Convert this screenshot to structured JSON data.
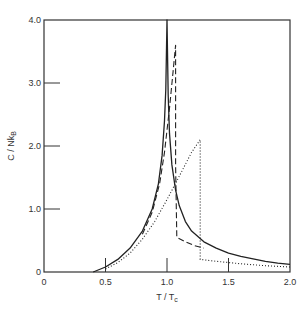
{
  "chart_data": {
    "type": "line",
    "title": "",
    "xlabel": "T / T_c",
    "ylabel": "C / Nk_B",
    "xlim": [
      0,
      2.0
    ],
    "ylim": [
      0,
      4.0
    ],
    "grid": false,
    "legend": null,
    "xticks": [
      {
        "value": 0,
        "label": "0"
      },
      {
        "value": 0.5,
        "label": "0.5"
      },
      {
        "value": 1.0,
        "label": "1.0"
      },
      {
        "value": 1.5,
        "label": "1.5"
      },
      {
        "value": 2.0,
        "label": "2.0"
      }
    ],
    "yticks": [
      {
        "value": 0,
        "label": "0"
      },
      {
        "value": 1.0,
        "label": "1.0"
      },
      {
        "value": 2.0,
        "label": "2.0"
      },
      {
        "value": 3.0,
        "label": "3.0"
      },
      {
        "value": 4.0,
        "label": "4.0"
      }
    ],
    "series": [
      {
        "name": "solid",
        "style": "solid",
        "x": [
          0.4,
          0.5,
          0.6,
          0.7,
          0.8,
          0.88,
          0.93,
          0.96,
          0.98,
          0.99,
          1.0,
          1.0,
          1.01,
          1.02,
          1.04,
          1.07,
          1.1,
          1.15,
          1.2,
          1.3,
          1.4,
          1.5,
          1.6,
          1.7,
          1.8,
          1.9,
          2.0
        ],
        "y": [
          0.0,
          0.08,
          0.2,
          0.38,
          0.65,
          1.0,
          1.4,
          1.85,
          2.4,
          2.9,
          4.0,
          4.0,
          2.8,
          2.2,
          1.7,
          1.3,
          1.05,
          0.8,
          0.65,
          0.48,
          0.38,
          0.3,
          0.25,
          0.21,
          0.17,
          0.14,
          0.12
        ]
      },
      {
        "name": "dashed",
        "style": "dashed",
        "x": [
          0.8,
          0.88,
          0.94,
          0.98,
          1.02,
          1.05,
          1.07,
          1.07,
          1.08,
          1.15,
          1.22,
          1.3
        ],
        "y": [
          0.6,
          0.95,
          1.4,
          1.9,
          2.6,
          3.2,
          3.6,
          1.7,
          0.55,
          0.48,
          0.42,
          0.38
        ]
      },
      {
        "name": "dotted",
        "style": "dotted",
        "x": [
          0.5,
          0.6,
          0.7,
          0.8,
          0.9,
          1.0,
          1.1,
          1.2,
          1.27,
          1.27,
          1.4,
          1.6,
          1.8,
          2.0
        ],
        "y": [
          0.05,
          0.15,
          0.3,
          0.52,
          0.8,
          1.15,
          1.52,
          1.9,
          2.1,
          0.2,
          0.17,
          0.13,
          0.1,
          0.08
        ]
      }
    ]
  }
}
